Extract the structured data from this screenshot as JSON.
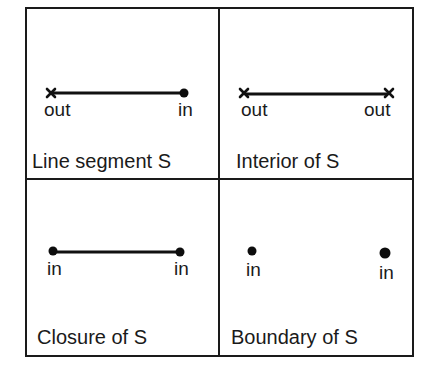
{
  "figure": {
    "colors": {
      "ink": "#1a1a1a",
      "background": "#ffffff"
    },
    "panels": [
      {
        "id": "line-segment",
        "caption": "Line segment S",
        "segment_drawn": true,
        "left_endpoint": {
          "marker": "cross",
          "label": "out"
        },
        "right_endpoint": {
          "marker": "dot",
          "label": "in"
        }
      },
      {
        "id": "interior",
        "caption": "Interior of S",
        "segment_drawn": true,
        "left_endpoint": {
          "marker": "cross",
          "label": "out"
        },
        "right_endpoint": {
          "marker": "cross",
          "label": "out"
        }
      },
      {
        "id": "closure",
        "caption": "Closure of S",
        "segment_drawn": true,
        "left_endpoint": {
          "marker": "dot",
          "label": "in"
        },
        "right_endpoint": {
          "marker": "dot",
          "label": "in"
        }
      },
      {
        "id": "boundary",
        "caption": "Boundary of S",
        "segment_drawn": false,
        "left_endpoint": {
          "marker": "dot",
          "label": "in"
        },
        "right_endpoint": {
          "marker": "dot",
          "label": "in"
        }
      }
    ]
  }
}
